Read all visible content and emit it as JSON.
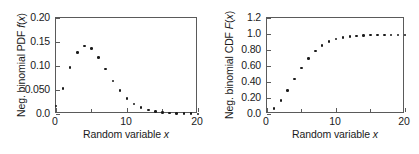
{
  "figure": {
    "background": "#ffffff",
    "marker_color": "#1a1a1a",
    "axis_color": "#5a5a5a"
  },
  "chart_data": [
    {
      "type": "scatter",
      "panel": "left",
      "title": "",
      "xlabel": "Random variable x",
      "ylabel": "Neg. binomial PDF f(x)",
      "xlim": [
        0,
        20
      ],
      "ylim": [
        0,
        0.2
      ],
      "grid": false,
      "legend": null,
      "xticks": [
        0,
        10,
        20
      ],
      "xtick_labels": [
        "0",
        "10",
        "20"
      ],
      "xminor_ticks": [
        5,
        15
      ],
      "yticks": [
        0,
        0.05,
        0.1,
        0.15,
        0.2
      ],
      "ytick_labels": [
        "0.0",
        "0.050",
        "0.10",
        "0.15",
        "0.20"
      ],
      "x": [
        0,
        1,
        2,
        3,
        4,
        5,
        6,
        7,
        8,
        9,
        10,
        11,
        12,
        13,
        14,
        15,
        16,
        17,
        18,
        19,
        20
      ],
      "y": [
        0.017,
        0.053,
        0.097,
        0.128,
        0.142,
        0.136,
        0.118,
        0.094,
        0.069,
        0.049,
        0.032,
        0.021,
        0.013,
        0.008,
        0.005,
        0.003,
        0.002,
        0.001,
        0.001,
        0.0005,
        0.0002
      ]
    },
    {
      "type": "scatter",
      "panel": "right",
      "title": "",
      "xlabel": "Random variable x",
      "ylabel": "Neg. binomial CDF F(x)",
      "xlim": [
        0,
        20
      ],
      "ylim": [
        0,
        1.2
      ],
      "grid": false,
      "legend": null,
      "xticks": [
        0,
        10,
        20
      ],
      "xtick_labels": [
        "0",
        "10",
        "20"
      ],
      "xminor_ticks": [
        5,
        15
      ],
      "yticks": [
        0,
        0.2,
        0.4,
        0.6,
        0.8,
        1.0,
        1.2
      ],
      "ytick_labels": [
        "0.0",
        "0.20",
        "0.40",
        "0.60",
        "0.80",
        "1.0",
        "1.2"
      ],
      "x": [
        1,
        2,
        3,
        4,
        5,
        6,
        7,
        8,
        9,
        10,
        11,
        12,
        13,
        14,
        15,
        16,
        17,
        18,
        19,
        20
      ],
      "y": [
        0.07,
        0.167,
        0.295,
        0.437,
        0.573,
        0.691,
        0.785,
        0.854,
        0.903,
        0.935,
        0.956,
        0.969,
        0.977,
        0.982,
        0.985,
        0.987,
        0.988,
        0.988,
        0.989,
        0.989
      ]
    }
  ]
}
